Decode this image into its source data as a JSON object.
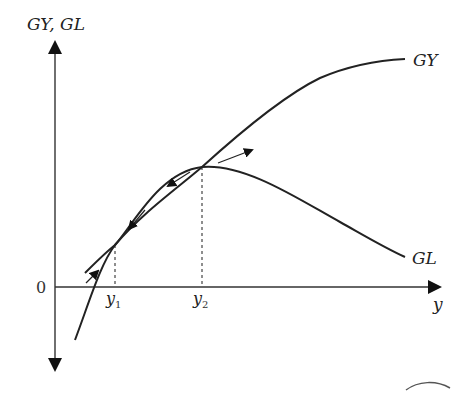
{
  "diagram": {
    "y_axis_label": "GY, GL",
    "x_axis_label": "y",
    "origin_label": "0",
    "tick_labels": {
      "y1": {
        "base": "y",
        "sub": "1"
      },
      "y2": {
        "base": "y",
        "sub": "2"
      }
    },
    "curves": [
      {
        "name": "GY",
        "label": "GY",
        "shape": "increasing, concave"
      },
      {
        "name": "GL",
        "label": "GL",
        "shape": "hump-shaped, peaks at y2"
      }
    ],
    "points": [
      {
        "name": "intersection-low",
        "x_label": "y1",
        "description": "GY crosses GL (unstable)"
      },
      {
        "name": "intersection-high",
        "x_label": "y2",
        "description": "GY crosses GL at GL peak (stable)"
      }
    ],
    "direction_arrows": [
      {
        "location": "left of y1",
        "direction": "toward y1 moving up-right"
      },
      {
        "location": "between y1 and y2 (lower)",
        "direction": "toward y1 moving down-left"
      },
      {
        "location": "between y1 and y2 (upper)",
        "direction": "toward y1 moving down-left"
      },
      {
        "location": "right of y2",
        "direction": "away from y2 moving up-right"
      }
    ],
    "colors": {
      "line": "#222222",
      "background": "#ffffff"
    }
  }
}
